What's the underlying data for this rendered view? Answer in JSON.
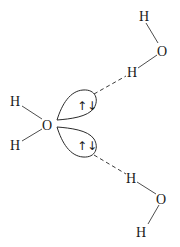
{
  "diagram": {
    "type": "hydrogen-bonding",
    "central_molecule": {
      "oxygen": "O",
      "hydrogen_upper": "H",
      "hydrogen_lower": "H",
      "lone_pair_upper": "↑↓",
      "lone_pair_lower": "↑↓"
    },
    "upper_molecule": {
      "hydrogen_top": "H",
      "oxygen": "O",
      "hydrogen_bridge": "H"
    },
    "lower_molecule": {
      "hydrogen_bridge": "H",
      "oxygen": "O",
      "hydrogen_bottom": "H"
    },
    "colors": {
      "ink": "#1a1a1a",
      "line": "#3a3a3a",
      "background": "#ffffff"
    }
  }
}
